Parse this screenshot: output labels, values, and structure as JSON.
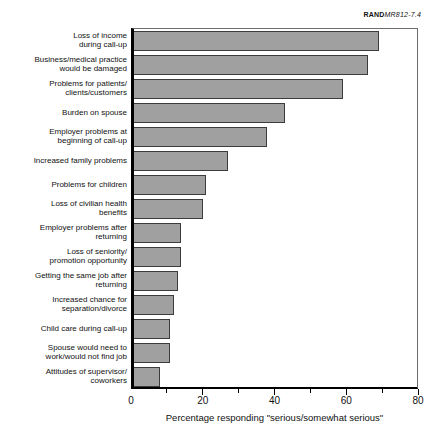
{
  "annotation": {
    "prefix": "RAND",
    "doc_id": "MR812-7.4"
  },
  "chart_data": {
    "type": "bar",
    "orientation": "horizontal",
    "xlabel": "Percentage responding \"serious/somewhat serious\"",
    "xlim": [
      0,
      80
    ],
    "x_major_ticks": [
      0,
      20,
      40,
      60,
      80
    ],
    "x_minor_ticks": [
      10,
      30,
      50,
      70
    ],
    "grid": false,
    "legend": "none",
    "categories": [
      "Loss of income during call-up",
      "Business/medical practice would be damaged",
      "Problems for patients/clients/customers",
      "Burden on spouse",
      "Employer problems at beginning of call-up",
      "Increased family problems",
      "Problems for children",
      "Loss of civilian health benefits",
      "Employer problems after returning",
      "Loss of seniority/promotion opportunity",
      "Getting the same job after returning",
      "Increased chance for separation/divorce",
      "Child care during call-up",
      "Spouse would need to work/would not find job",
      "Attitudes of supervisor/coworkers"
    ],
    "category_label_lines": [
      [
        "Loss of income",
        "during call-up"
      ],
      [
        "Business/medical practice",
        "would be damaged"
      ],
      [
        "Problems for patients/",
        "clients/customers"
      ],
      [
        "Burden on spouse"
      ],
      [
        "Employer problems at",
        "beginning of call-up"
      ],
      [
        "Increased family problems"
      ],
      [
        "Problems for children"
      ],
      [
        "Loss of civilian health",
        "benefits"
      ],
      [
        "Employer problems after",
        "returning"
      ],
      [
        "Loss of seniority/",
        "promotion opportunity"
      ],
      [
        "Getting the same job after",
        "returning"
      ],
      [
        "Increased chance for",
        "separation/divorce"
      ],
      [
        "Child care during call-up"
      ],
      [
        "Spouse would need to",
        "work/would not find job"
      ],
      [
        "Attitudes of supervisor/",
        "coworkers"
      ]
    ],
    "values": [
      69,
      66,
      59,
      43,
      38,
      27,
      21,
      20,
      14,
      14,
      13,
      12,
      11,
      11,
      8
    ],
    "colors": {
      "bar_fill": "#a0a0a0",
      "bar_border": "#3c3c3c",
      "axis": "#000000",
      "frame": "#6e6e6e",
      "background": "#ffffff"
    }
  }
}
